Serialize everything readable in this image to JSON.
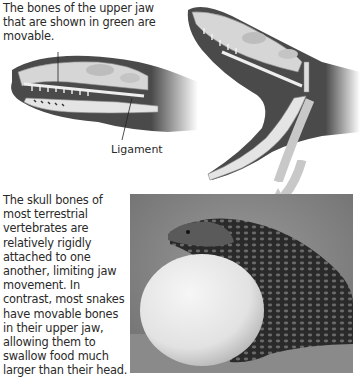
{
  "figure": {
    "top_caption": "The bones of the upper jaw that are shown in green are movable.",
    "ligament_label": "Ligament",
    "body_caption": "The skull bones of most terrestrial vertebrates are relatively rigidly attached to one another, limiting jaw movement. In contrast, most snakes have movable bones in their upper jaw, allowing them to swallow food much larger than their head.",
    "panels": [
      {
        "name": "closed-jaw-skull",
        "description": "Snake head with skull, jaw closed"
      },
      {
        "name": "open-jaw-skull",
        "description": "Snake head with skull, jaw opened wide"
      },
      {
        "name": "snake-swallowing-egg-photo",
        "description": "Photo of snake swallowing an egg"
      }
    ],
    "colors": {
      "head_dark": "#4a4a4a",
      "bone_light": "#d9d9d9",
      "arrow": "#c8c8c8",
      "egg": "#ececec"
    }
  }
}
